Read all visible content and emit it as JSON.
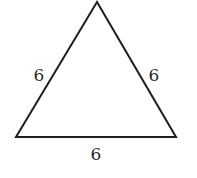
{
  "figure": {
    "shape": "equilateral-triangle",
    "stroke_color": "#1e1e1e",
    "vertices": {
      "top": [
        97,
        2
      ],
      "bottom_left": [
        16,
        137
      ],
      "bottom_right": [
        176,
        137
      ]
    },
    "side_labels": {
      "left": "6",
      "right": "6",
      "bottom": "6"
    }
  }
}
